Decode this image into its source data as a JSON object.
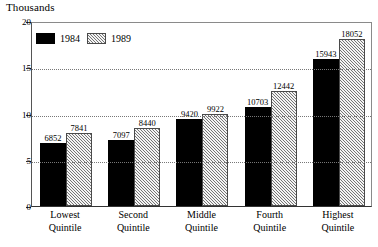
{
  "chart_data": {
    "type": "bar",
    "title": "",
    "subtitle": "",
    "xlabel": "",
    "ylabel": "Thousands",
    "ylim": [
      0,
      20
    ],
    "yticks": [
      0,
      5,
      10,
      15,
      20
    ],
    "ytick_labels": [
      "0",
      "5",
      "10",
      "15",
      "20"
    ],
    "grid": true,
    "grid_axis": "y",
    "grid_style": "dotted",
    "legend_position": "top-left",
    "categories": [
      "Lowest Quintile",
      "Second Quintile",
      "Middle Quintile",
      "Fourth Quintile",
      "Highest Quintile"
    ],
    "category_lines": [
      [
        "Lowest",
        "Quintile"
      ],
      [
        "Second",
        "Quintile"
      ],
      [
        "Middle",
        "Quintile"
      ],
      [
        "Fourth",
        "Quintile"
      ],
      [
        "Highest",
        "Quintile"
      ]
    ],
    "value_scale": 1000,
    "value_unit": "Thousands",
    "series": [
      {
        "name": "1984",
        "color": "#000000",
        "fill": "solid-black",
        "values": [
          6852,
          7097,
          9420,
          10703,
          15943
        ],
        "labels": [
          "6852",
          "7097",
          "9420",
          "10703",
          "15943"
        ]
      },
      {
        "name": "1989",
        "color": "#b4b4b4",
        "fill": "gray-diagonal-hatch",
        "values": [
          7841,
          8440,
          9922,
          12442,
          18052
        ],
        "labels": [
          "7841",
          "8440",
          "9922",
          "12442",
          "18052"
        ]
      }
    ]
  },
  "legend": {
    "items": [
      {
        "label": "1984",
        "swatch": "solid-black-swatch"
      },
      {
        "label": "1989",
        "swatch": "gray-hatched-swatch"
      }
    ]
  },
  "axis": {
    "y_title": "Thousands",
    "y_labels": [
      "20",
      "15",
      "10",
      "5",
      "0"
    ]
  },
  "colors": {
    "series_1984": "#000000",
    "series_1989": "#b4b4b4",
    "frame": "#555555",
    "gridline": "#777777",
    "background": "#ffffff",
    "text": "#000000"
  }
}
